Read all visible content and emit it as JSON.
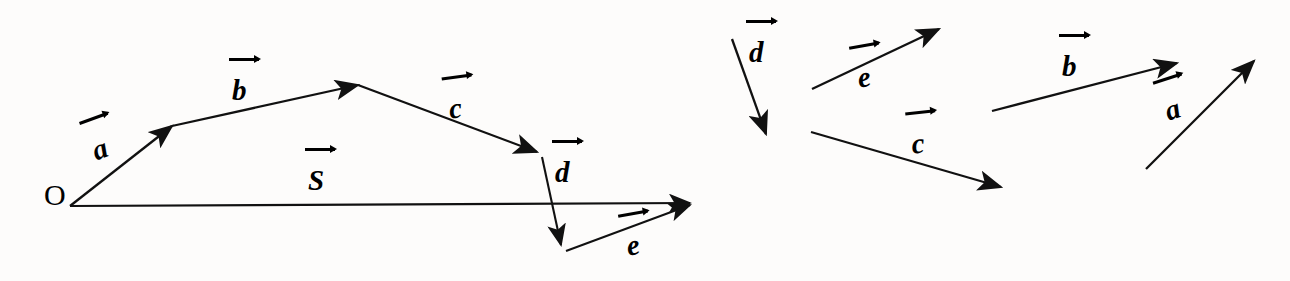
{
  "figure": {
    "background_color": "#fdfcfb",
    "stroke_color": "#111111",
    "origin_label": "O",
    "panels": [
      {
        "name": "resultant-polygon",
        "description": "Head-to-tail vector addition polygon with resultant S from origin O"
      },
      {
        "name": "component-vectors",
        "description": "Five free vectors drawn separately: d, e, c, b, a"
      }
    ]
  },
  "chart_data": {
    "type": "diagram",
    "title": "",
    "xlabel": "",
    "ylabel": "",
    "coordinate_system": "pixel, origin top-left, 1290x281",
    "vectors": [
      {
        "id": "left-a",
        "label": "a",
        "panel": "resultant-polygon",
        "x1": 70,
        "y1": 206,
        "x2": 172,
        "y2": 126,
        "label_x": 88,
        "label_y": 138,
        "label_rotation": -20
      },
      {
        "id": "left-b",
        "label": "b",
        "panel": "resultant-polygon",
        "x1": 172,
        "y1": 126,
        "x2": 358,
        "y2": 85,
        "label_x": 232,
        "label_y": 76,
        "label_rotation": 0
      },
      {
        "id": "left-c",
        "label": "c",
        "panel": "resultant-polygon",
        "x1": 358,
        "y1": 85,
        "x2": 537,
        "y2": 152,
        "label_x": 447,
        "label_y": 95,
        "label_rotation": -8
      },
      {
        "id": "left-d",
        "label": "d",
        "panel": "resultant-polygon",
        "x1": 542,
        "y1": 157,
        "x2": 561,
        "y2": 245,
        "label_x": 555,
        "label_y": 158,
        "label_rotation": 0
      },
      {
        "id": "left-e",
        "label": "e",
        "panel": "resultant-polygon",
        "x1": 566,
        "y1": 251,
        "x2": 690,
        "y2": 205,
        "label_x": 624,
        "label_y": 232,
        "label_rotation": -10
      },
      {
        "id": "left-S",
        "label": "S",
        "panel": "resultant-polygon",
        "x1": 70,
        "y1": 206,
        "x2": 690,
        "y2": 203,
        "label_x": 308,
        "label_y": 166,
        "label_rotation": 0
      },
      {
        "id": "right-d",
        "label": "d",
        "panel": "component-vectors",
        "x1": 732,
        "y1": 39,
        "x2": 766,
        "y2": 134,
        "label_x": 749,
        "label_y": 38,
        "label_rotation": 0
      },
      {
        "id": "right-e",
        "label": "e",
        "panel": "component-vectors",
        "x1": 812,
        "y1": 89,
        "x2": 939,
        "y2": 29,
        "label_x": 855,
        "label_y": 64,
        "label_rotation": -10
      },
      {
        "id": "right-c",
        "label": "c",
        "panel": "component-vectors",
        "x1": 811,
        "y1": 132,
        "x2": 1001,
        "y2": 187,
        "label_x": 910,
        "label_y": 130,
        "label_rotation": -6
      },
      {
        "id": "right-b",
        "label": "b",
        "panel": "component-vectors",
        "x1": 992,
        "y1": 111,
        "x2": 1177,
        "y2": 63,
        "label_x": 1062,
        "label_y": 52,
        "label_rotation": 0
      },
      {
        "id": "right-a",
        "label": "a",
        "panel": "component-vectors",
        "x1": 1146,
        "y1": 169,
        "x2": 1254,
        "y2": 61,
        "label_x": 1161,
        "label_y": 98,
        "label_rotation": -18
      }
    ]
  }
}
